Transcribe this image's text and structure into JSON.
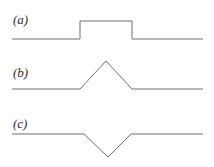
{
  "figure": {
    "width": 214,
    "height": 167,
    "background_color": "#ffffff",
    "line_color": "#6e6e6e",
    "label_color": "#2b2b2b",
    "panel_count": 3
  },
  "panels": [
    {
      "label": "(a)",
      "waveform_name": "rectangular-pulse",
      "baseline_y": 39,
      "peak_y": 21,
      "x_start": 12,
      "x_end": 203,
      "edge_left_x": 80,
      "edge_right_x": 132,
      "points": "12,39 80,39 80,21 132,21 132,39 203,39"
    },
    {
      "label": "(b)",
      "waveform_name": "upward-triangular-pulse",
      "baseline_y": 34,
      "peak_y": 6,
      "x_start": 12,
      "x_end": 203,
      "edge_left_x": 80,
      "edge_right_x": 132,
      "apex_x": 106,
      "points": "12,34 80,34 106,6 132,34 203,34"
    },
    {
      "label": "(c)",
      "waveform_name": "downward-triangular-pulse",
      "baseline_y": 24,
      "trough_y": 47,
      "x_start": 12,
      "x_end": 203,
      "edge_left_x": 84,
      "edge_right_x": 131,
      "trough_x": 108,
      "points": "12,24 84,24 108,47 131,24 203,24"
    }
  ],
  "chart_data": {
    "type": "line",
    "title": "",
    "xlabel": "",
    "ylabel": "",
    "grid": false,
    "legend": null,
    "subplots": [
      {
        "name": "(a)",
        "description": "rectangular pulse",
        "x": [
          0,
          0.355,
          0.355,
          0.627,
          0.627,
          1.0
        ],
        "y": [
          0,
          0,
          1,
          1,
          0,
          0
        ]
      },
      {
        "name": "(b)",
        "description": "upward triangular pulse",
        "x": [
          0,
          0.355,
          0.492,
          0.627,
          1.0
        ],
        "y": [
          0,
          0,
          1,
          0,
          0
        ]
      },
      {
        "name": "(c)",
        "description": "downward triangular pulse",
        "x": [
          0,
          0.377,
          0.502,
          0.623,
          1.0
        ],
        "y": [
          0,
          0,
          -1,
          0,
          0
        ]
      }
    ]
  }
}
